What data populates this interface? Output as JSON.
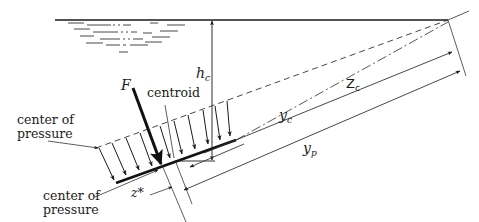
{
  "diagram": {
    "type": "hydrostatic-force-on-inclined-plane",
    "labels": {
      "force": "F",
      "centroid": "centroid",
      "center_of_pressure_top_line1": "center of",
      "center_of_pressure_top_line2": "pressure",
      "center_of_pressure_bottom_line1": "center of",
      "center_of_pressure_bottom_line2": "pressure",
      "h_c_main": "h",
      "h_c_sub": "c",
      "Z_c_main": "Z",
      "Z_c_sub": "c",
      "y_c_main": "y",
      "y_c_sub": "c",
      "y_p_main": "y",
      "y_p_sub": "p",
      "z_star": "z*"
    },
    "colors": {
      "line": "#1a1a1a",
      "thin_line": "#444444",
      "background": "#ffffff"
    }
  }
}
